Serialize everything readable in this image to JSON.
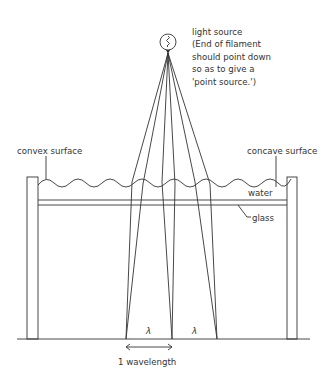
{
  "diagram": {
    "light_source": {
      "label": "light source",
      "note_lines": [
        "(End of filament",
        "should point down",
        "so as to give a",
        "'point source.')"
      ]
    },
    "labels": {
      "convex": "convex surface",
      "concave": "concave surface",
      "water": "water",
      "glass": "glass",
      "lambda_1": "λ",
      "lambda_2": "λ",
      "wavelength": "1 wavelength"
    },
    "colors": {
      "line": "#333333",
      "background": "#ffffff"
    }
  }
}
